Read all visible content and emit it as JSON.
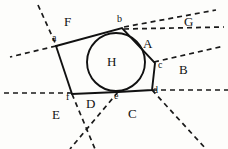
{
  "figure": {
    "stroke_color": "#111111",
    "dash_color": "#1a1a1a",
    "background": "#fdfdfb"
  },
  "polygon": {
    "name": "circumscribed-hexagon",
    "vertices": [
      {
        "id": "a",
        "x": 56,
        "y": 46
      },
      {
        "id": "b",
        "x": 122,
        "y": 28
      },
      {
        "id": "c",
        "x": 155,
        "y": 63
      },
      {
        "id": "d",
        "x": 152,
        "y": 90
      },
      {
        "id": "e",
        "x": 118,
        "y": 92
      },
      {
        "id": "f",
        "x": 72,
        "y": 94
      }
    ],
    "points_string": "56,46 122,28 155,63 152,90 118,92 72,94"
  },
  "circle": {
    "name": "inscribed-circle",
    "cx": 116,
    "cy": 62,
    "r": 29
  },
  "dashed_lines": [
    {
      "id": "line-a-up",
      "x1": 38,
      "y1": 5,
      "x2": 57,
      "y2": 47
    },
    {
      "id": "line-a-left",
      "x1": 56,
      "y1": 46,
      "x2": 10,
      "y2": 57
    },
    {
      "id": "line-b-upper",
      "x1": 124,
      "y1": 27,
      "x2": 216,
      "y2": 10
    },
    {
      "id": "line-b-lower",
      "x1": 124,
      "y1": 29,
      "x2": 224,
      "y2": 27
    },
    {
      "id": "line-c-right",
      "x1": 154,
      "y1": 62,
      "x2": 224,
      "y2": 46
    },
    {
      "id": "line-d-right",
      "x1": 152,
      "y1": 90,
      "x2": 228,
      "y2": 90
    },
    {
      "id": "line-f-left",
      "x1": 72,
      "y1": 93,
      "x2": 2,
      "y2": 93
    },
    {
      "id": "line-f-down",
      "x1": 72,
      "y1": 94,
      "x2": 95,
      "y2": 149
    },
    {
      "id": "line-e-down",
      "x1": 118,
      "y1": 92,
      "x2": 70,
      "y2": 149
    },
    {
      "id": "line-d-down",
      "x1": 152,
      "y1": 90,
      "x2": 206,
      "y2": 149
    }
  ],
  "region_labels": [
    {
      "id": "A",
      "text": "A",
      "x": 143,
      "y": 37
    },
    {
      "id": "B",
      "text": "B",
      "x": 179,
      "y": 63
    },
    {
      "id": "C",
      "text": "C",
      "x": 128,
      "y": 107
    },
    {
      "id": "D",
      "text": "D",
      "x": 86,
      "y": 97
    },
    {
      "id": "E",
      "text": "E",
      "x": 52,
      "y": 108
    },
    {
      "id": "F",
      "text": "F",
      "x": 64,
      "y": 15
    },
    {
      "id": "G",
      "text": "G",
      "x": 184,
      "y": 15
    },
    {
      "id": "H",
      "text": "H",
      "x": 107,
      "y": 55
    }
  ],
  "vertex_labels": [
    {
      "id": "a",
      "text": "a",
      "x": 52,
      "y": 33
    },
    {
      "id": "b",
      "text": "b",
      "x": 117,
      "y": 14
    },
    {
      "id": "c",
      "text": "c",
      "x": 158,
      "y": 60
    },
    {
      "id": "d",
      "text": "d",
      "x": 153,
      "y": 85
    },
    {
      "id": "e",
      "text": "e",
      "x": 114,
      "y": 91
    },
    {
      "id": "f",
      "text": "f",
      "x": 66,
      "y": 92
    }
  ]
}
